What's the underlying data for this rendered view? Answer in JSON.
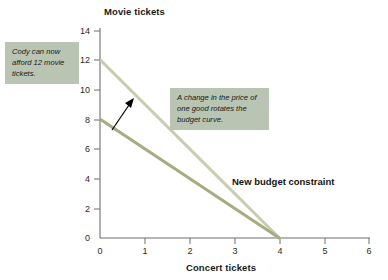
{
  "chart_data": {
    "type": "line",
    "title": "",
    "xlabel": "Concert tickets",
    "ylabel": "Movie tickets",
    "xlim": [
      0,
      6
    ],
    "ylim": [
      0,
      14
    ],
    "xticks": [
      "0",
      "1",
      "2",
      "3",
      "4",
      "5",
      "6"
    ],
    "yticks": [
      "0",
      "2",
      "4",
      "6",
      "8",
      "10",
      "12",
      "14"
    ],
    "grid": false,
    "legend_position": "none",
    "series": [
      {
        "name": "New budget constraint",
        "color": "#c9cdb0",
        "points": [
          [
            0,
            12
          ],
          [
            4,
            0
          ]
        ]
      },
      {
        "name": "Original budget constraint",
        "color": "#a8ab80",
        "points": [
          [
            0,
            8
          ],
          [
            4,
            0
          ]
        ]
      }
    ],
    "annotations": [
      {
        "id": "callout-afford",
        "text": "Cody can now afford 12 movie tickets.",
        "style": "callout-box"
      },
      {
        "id": "callout-rotates",
        "text": "A change in the price of one good rotates the budget curve.",
        "style": "callout-box"
      },
      {
        "id": "new-budget-label",
        "text": "New budget constraint",
        "style": "bold-label"
      },
      {
        "id": "rotation-arrow",
        "text": "",
        "style": "arrow",
        "from": [
          0.32,
          6.1
        ],
        "to": [
          0.63,
          7.9
        ]
      }
    ],
    "colors": {
      "new_line": "#c9cdb0",
      "original_line": "#a8ab80",
      "callout_background": "#b9c4b3",
      "axis": "#6f6f6f",
      "text": "#1a1a1a",
      "arrow": "#000000",
      "background": "#ffffff"
    }
  },
  "axes": {
    "y_title": "Movie tickets",
    "x_title": "Concert tickets"
  },
  "labels": {
    "new_budget_constraint": "New budget constraint",
    "callout_afford": "Cody can now afford 12 movie tickets.",
    "callout_rotates": "A change in the price of one good rotates the budget curve."
  }
}
